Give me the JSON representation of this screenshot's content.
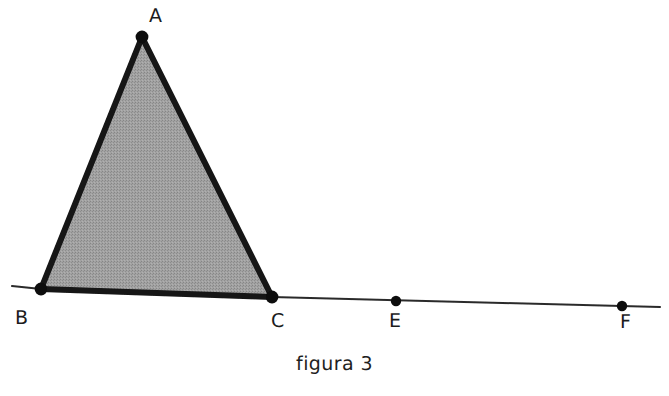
{
  "figure": {
    "caption": "figura 3",
    "background_color": "#ffffff",
    "stroke_color": "#1a1a1a",
    "thin_line_color": "#2b2b2b",
    "fill_color": "#9a9a9a",
    "label_color": "#1c1c1c",
    "labels": {
      "a": "A",
      "b": "B",
      "c": "C",
      "e": "E",
      "f": "F"
    },
    "points": [
      {
        "name": "A",
        "label": "A",
        "x": 142,
        "y": 37
      },
      {
        "name": "B",
        "label": "B",
        "x": 41,
        "y": 289
      },
      {
        "name": "C",
        "label": "C",
        "x": 272,
        "y": 297
      },
      {
        "name": "E",
        "label": "E",
        "x": 396,
        "y": 301
      },
      {
        "name": "F",
        "label": "F",
        "x": 622,
        "y": 306
      }
    ],
    "triangle": {
      "vertices": [
        "A",
        "B",
        "C"
      ],
      "filled": true
    },
    "baseline": {
      "from_x": 12,
      "from_y": 286,
      "to_x": 660,
      "to_y": 307
    }
  }
}
